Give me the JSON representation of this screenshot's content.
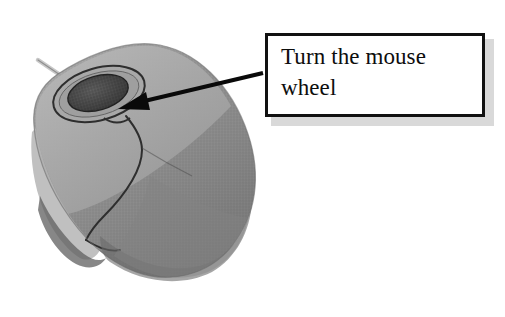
{
  "figure": {
    "title": "Turn the mouse wheel",
    "background_color": "#ffffff",
    "width": 505,
    "height": 317
  },
  "callout": {
    "text": "Turn the mouse wheel",
    "border_color": "#111111",
    "fill_color": "#ffffff",
    "shadow_color": "#b9b9b9",
    "box": {
      "x": 265,
      "y": 33,
      "width": 220,
      "height": 84
    }
  },
  "arrow": {
    "name": "pointer-arrow",
    "color": "#0a0a0a",
    "from": {
      "x": 263,
      "y": 73
    },
    "to": {
      "x": 118,
      "y": 109
    }
  },
  "illustration": {
    "subject": "computer-mouse",
    "view": "three-quarter-top",
    "colors": {
      "body_light": "#a9a9a9",
      "body_mid": "#8c8c8c",
      "body_dark": "#6f6f6f",
      "shadow": "#5a5a5a",
      "wheel": "#4a4a4a",
      "wheel_recess": "#9e9e9e",
      "outline": "#2c2c2c",
      "cable": "#bdbdbd"
    },
    "parts": [
      {
        "name": "mouse-body",
        "label": "mouse body"
      },
      {
        "name": "left-button",
        "label": "left button"
      },
      {
        "name": "right-button",
        "label": "right button"
      },
      {
        "name": "scroll-wheel",
        "label": "scroll wheel"
      },
      {
        "name": "wheel-recess",
        "label": "wheel recess"
      },
      {
        "name": "mouse-cable",
        "label": "cable"
      }
    ]
  }
}
